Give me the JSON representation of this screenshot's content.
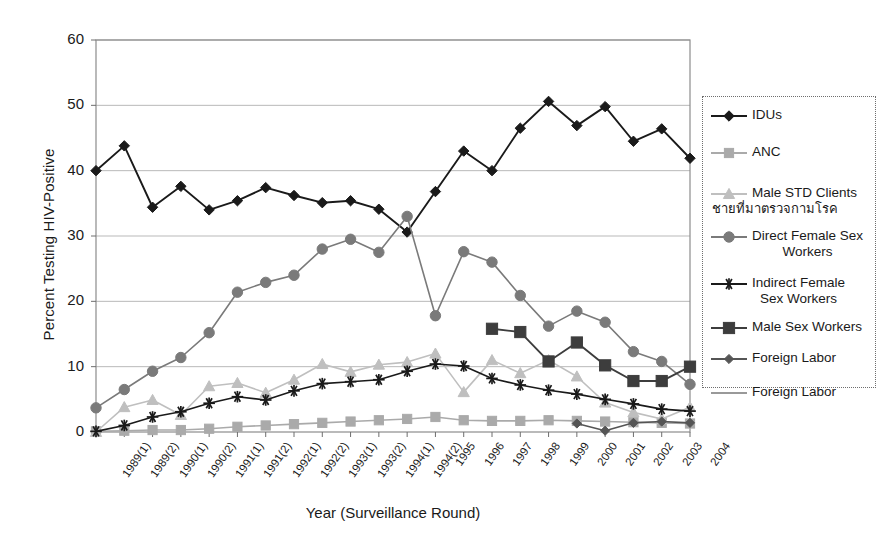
{
  "chart_data": {
    "type": "line",
    "title": "",
    "xlabel": "Year (Surveillance Round)",
    "ylabel": "Percent Testing HIV-Positive",
    "ylim": [
      0,
      60
    ],
    "yticks": [
      0,
      10,
      20,
      30,
      40,
      50,
      60
    ],
    "grid": "horizontal",
    "legend_position": "right",
    "categories": [
      "1989(1)",
      "1989(2)",
      "1990(1)",
      "1990(2)",
      "1991(1)",
      "1991(2)",
      "1992(1)",
      "1992(2)",
      "1993(1)",
      "1993(2)",
      "1994(1)",
      "1994(2)",
      "1995",
      "1996",
      "1997",
      "1998",
      "1999",
      "2000",
      "2001",
      "2002",
      "2003",
      "2004"
    ],
    "series": [
      {
        "name": "IDUs",
        "color": "#1a1a1a",
        "marker": "diamond",
        "values": [
          40.0,
          43.8,
          34.4,
          37.6,
          34.0,
          35.4,
          37.4,
          36.2,
          35.1,
          35.4,
          34.1,
          30.6,
          36.8,
          43.0,
          40.0,
          46.5,
          50.6,
          46.9,
          49.8,
          44.5,
          46.4,
          41.9
        ]
      },
      {
        "name": "ANC",
        "color": "#aaaaaa",
        "marker": "square",
        "values": [
          0.1,
          0.2,
          0.3,
          0.3,
          0.5,
          0.8,
          1.0,
          1.2,
          1.4,
          1.6,
          1.8,
          2.0,
          2.3,
          1.8,
          1.7,
          1.7,
          1.8,
          1.7,
          1.6,
          1.5,
          1.4,
          1.3
        ]
      },
      {
        "name": "Male STD Clients",
        "name_thai": "ชายที่มาตรวจกามโรค",
        "color": "#bfbfbf",
        "marker": "triangle",
        "values": [
          0.0,
          3.8,
          4.9,
          2.6,
          7.0,
          7.5,
          6.0,
          8.0,
          10.4,
          9.2,
          10.3,
          10.7,
          12.0,
          6.1,
          11.0,
          9.0,
          11.0,
          8.5,
          4.5,
          3.0,
          2.0,
          3.8
        ]
      },
      {
        "name": "Direct Female Sex Workers",
        "color": "#7a7a7a",
        "marker": "circle",
        "values": [
          3.7,
          6.5,
          9.3,
          11.4,
          15.2,
          21.4,
          22.9,
          24.0,
          28.0,
          29.5,
          27.5,
          33.0,
          17.8,
          27.6,
          26.0,
          20.9,
          16.2,
          18.5,
          16.8,
          12.3,
          10.8,
          7.3
        ]
      },
      {
        "name": "Indirect Female Sex Workers",
        "color": "#1a1a1a",
        "marker": "asterisk",
        "values": [
          0.1,
          1.0,
          2.3,
          3.1,
          4.4,
          5.4,
          4.9,
          6.3,
          7.4,
          7.7,
          8.0,
          9.3,
          10.4,
          10.1,
          8.2,
          7.2,
          6.4,
          5.8,
          5.0,
          4.3,
          3.5,
          3.2
        ]
      },
      {
        "name": "Male Sex Workers",
        "color": "#3d3d3d",
        "marker": "square-large",
        "values": [
          null,
          null,
          null,
          null,
          null,
          null,
          null,
          null,
          null,
          null,
          null,
          null,
          null,
          null,
          15.8,
          15.3,
          10.8,
          13.7,
          10.2,
          7.8,
          7.8,
          10.0
        ]
      },
      {
        "name": "Foreign Labor",
        "color": "#555555",
        "marker": "diamond-small",
        "values": [
          null,
          null,
          null,
          null,
          null,
          null,
          null,
          null,
          null,
          null,
          null,
          null,
          null,
          null,
          null,
          null,
          null,
          1.3,
          0.2,
          1.4,
          1.6,
          1.4
        ]
      },
      {
        "name": "Foreign Labor",
        "color": "#999999",
        "marker": "none",
        "values": [
          null,
          null,
          null,
          null,
          null,
          null,
          null,
          null,
          null,
          null,
          null,
          null,
          null,
          null,
          null,
          null,
          null,
          null,
          null,
          null,
          null,
          null
        ]
      }
    ]
  },
  "axis": {
    "y_title": "Percent Testing HIV-Positive",
    "x_title": "Year (Surveillance Round)",
    "y_ticks": [
      "0",
      "10",
      "20",
      "30",
      "40",
      "50",
      "60"
    ],
    "x_ticks": [
      "1989(1)",
      "1989(2)",
      "1990(1)",
      "1990(2)",
      "1991(1)",
      "1991(2)",
      "1992(1)",
      "1992(2)",
      "1993(1)",
      "1993(2)",
      "1994(1)",
      "1994(2)",
      "1995",
      "1996",
      "1997",
      "1998",
      "1999",
      "2000",
      "2001",
      "2002",
      "2003",
      "2004"
    ]
  },
  "legend": {
    "entries": [
      {
        "label": "IDUs",
        "label2": "",
        "marker": "diamond",
        "color": "#1a1a1a"
      },
      {
        "label": "ANC",
        "label2": "",
        "marker": "square",
        "color": "#aaaaaa"
      },
      {
        "label": "Male STD Clients",
        "label2": "ชายที่มาตรวจกามโรค",
        "marker": "triangle",
        "color": "#bfbfbf"
      },
      {
        "label": "Direct Female Sex",
        "label2": "Workers",
        "marker": "circle",
        "color": "#7a7a7a"
      },
      {
        "label": "Indirect Female",
        "label2": "Sex Workers",
        "marker": "asterisk",
        "color": "#1a1a1a"
      },
      {
        "label": "Male Sex Workers",
        "label2": "",
        "marker": "square-large",
        "color": "#3d3d3d"
      },
      {
        "label": "Foreign Labor",
        "label2": "",
        "marker": "diamond-small",
        "color": "#555555"
      },
      {
        "label": "Foreign Labor",
        "label2": "",
        "marker": "none",
        "color": "#999999"
      }
    ]
  }
}
